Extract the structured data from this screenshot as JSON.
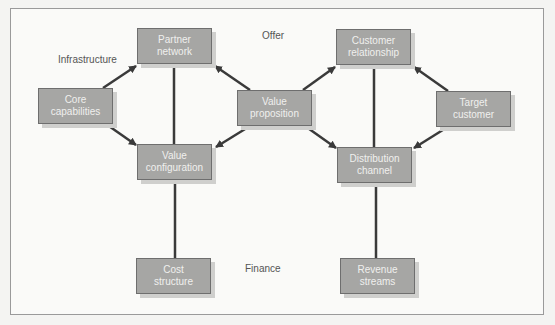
{
  "diagram": {
    "labels": {
      "infrastructure": "Infrastructure",
      "offer": "Offer",
      "finance": "Finance"
    },
    "boxes": {
      "partner_network": {
        "line1": "Partner",
        "line2": "network"
      },
      "customer_relationship": {
        "line1": "Customer",
        "line2": "relationship"
      },
      "core_capabilities": {
        "line1": "Core",
        "line2": "capabilities"
      },
      "value_proposition": {
        "line1": "Value",
        "line2": "proposition"
      },
      "target_customer": {
        "line1": "Target",
        "line2": "customer"
      },
      "value_configuration": {
        "line1": "Value",
        "line2": "configuration"
      },
      "distribution_channel": {
        "line1": "Distribution",
        "line2": "channel"
      },
      "cost_structure": {
        "line1": "Cost",
        "line2": "structure"
      },
      "revenue_streams": {
        "line1": "Revenue",
        "line2": "streams"
      }
    },
    "edges": [
      {
        "from": "core_capabilities",
        "to": "partner_network",
        "type": "arrow"
      },
      {
        "from": "core_capabilities",
        "to": "value_configuration",
        "type": "arrow"
      },
      {
        "from": "value_proposition",
        "to": "partner_network",
        "type": "arrow"
      },
      {
        "from": "value_proposition",
        "to": "value_configuration",
        "type": "arrow"
      },
      {
        "from": "value_proposition",
        "to": "customer_relationship",
        "type": "arrow"
      },
      {
        "from": "value_proposition",
        "to": "distribution_channel",
        "type": "arrow"
      },
      {
        "from": "target_customer",
        "to": "customer_relationship",
        "type": "arrow"
      },
      {
        "from": "target_customer",
        "to": "distribution_channel",
        "type": "arrow"
      },
      {
        "from": "partner_network",
        "to": "value_configuration",
        "type": "line"
      },
      {
        "from": "customer_relationship",
        "to": "distribution_channel",
        "type": "line"
      },
      {
        "from": "value_configuration",
        "to": "cost_structure",
        "type": "line"
      },
      {
        "from": "distribution_channel",
        "to": "revenue_streams",
        "type": "line"
      }
    ],
    "colors": {
      "box_fill": "#a6a6a4",
      "box_border": "#6e6e6e",
      "line": "#3a3a3a",
      "label": "#555555"
    }
  }
}
